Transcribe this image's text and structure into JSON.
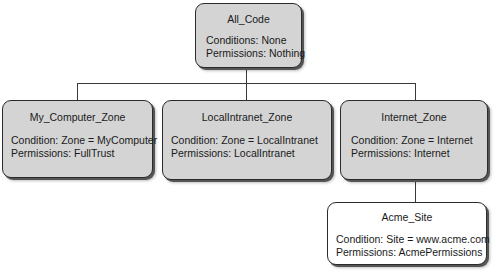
{
  "diagram": {
    "root": {
      "title": "All_Code",
      "condition": "Conditions: None",
      "permissions": "Permissions: Nothing"
    },
    "children": [
      {
        "title": "My_Computer_Zone",
        "condition": "Condition: Zone = MyComputer",
        "permissions": "Permissions: FullTrust"
      },
      {
        "title": "LocalIntranet_Zone",
        "condition": "Condition: Zone = LocalIntranet",
        "permissions": "Permissions: LocalIntranet"
      },
      {
        "title": "Internet_Zone",
        "condition": "Condition: Zone = Internet",
        "permissions": "Permissions: Internet"
      }
    ],
    "grandchild": {
      "title": "Acme_Site",
      "condition": "Condition: Site = www.acme.com",
      "permissions": "Permissions: AcmePermissions"
    }
  }
}
